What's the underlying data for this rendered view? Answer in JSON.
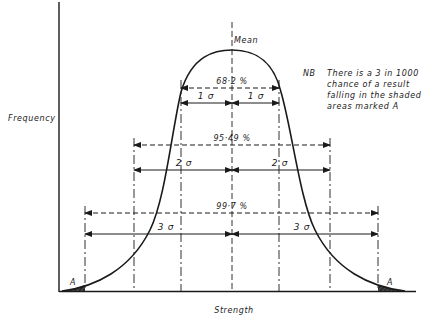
{
  "axes": {
    "y_label": "Frequency",
    "x_label": "Strength"
  },
  "mean_label": "Mean",
  "bands": [
    {
      "percent_label": "68·2 %",
      "sigma_label": "1 σ",
      "sigma": 1
    },
    {
      "percent_label": "95·49 %",
      "sigma_label": "2 σ",
      "sigma": 2
    },
    {
      "percent_label": "99·7 %",
      "sigma_label": "3 σ",
      "sigma": 3
    }
  ],
  "note": {
    "prefix": "NB",
    "lines": [
      "There is a 3 in 1000",
      "chance of a result",
      "falling in the shaded",
      "areas marked A"
    ]
  },
  "tail_label": "A",
  "colors": {
    "ink": "#1a1a1a",
    "background": "#ffffff"
  }
}
